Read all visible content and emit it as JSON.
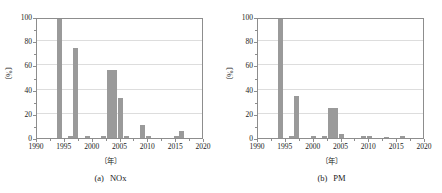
{
  "figure": {
    "background": "#ffffff",
    "bar_color": "#9a9a9a",
    "axis_color": "#8d8d8d",
    "grid_color": "#dddddd"
  },
  "panels": [
    {
      "caption_id": "(a)",
      "caption_text": "NOx",
      "ylabel": "〔%〕",
      "xlabel": "〔年〕",
      "y_ticks": [
        "0",
        "20",
        "40",
        "60",
        "80",
        "100"
      ],
      "x_ticks": [
        "1990",
        "1995",
        "2000",
        "2005",
        "2010",
        "2015",
        "2020"
      ]
    },
    {
      "caption_id": "(b)",
      "caption_text": "PM",
      "ylabel": "〔%〕",
      "xlabel": "〔年〕",
      "y_ticks": [
        "0",
        "20",
        "40",
        "60",
        "80",
        "100"
      ],
      "x_ticks": [
        "1990",
        "1995",
        "2000",
        "2005",
        "2010",
        "2015",
        "2020"
      ]
    }
  ],
  "chart_data": [
    {
      "type": "bar",
      "title": "(a) NOx",
      "xlabel": "〔年〕",
      "ylabel": "〔%〕",
      "xlim": [
        1990,
        2020
      ],
      "ylim": [
        0,
        100
      ],
      "xtick_step": 5,
      "ytick_step": 20,
      "grid": "horizontal",
      "legend": "none",
      "x": [
        1994,
        1996,
        1997,
        1999,
        2002,
        2003,
        2004,
        2005,
        2006,
        2009,
        2010,
        2015,
        2016
      ],
      "values": [
        100,
        1.5,
        74,
        1.5,
        1.5,
        56,
        56,
        33,
        1.5,
        11,
        1.5,
        1.5,
        6
      ]
    },
    {
      "type": "bar",
      "title": "(b) PM",
      "xlabel": "〔年〕",
      "ylabel": "〔%〕",
      "xlim": [
        1990,
        2020
      ],
      "ylim": [
        0,
        100
      ],
      "xtick_step": 5,
      "ytick_step": 20,
      "grid": "horizontal",
      "legend": "none",
      "x": [
        1994,
        1996,
        1997,
        2000,
        2002,
        2003,
        2004,
        2005,
        2009,
        2010,
        2013,
        2016
      ],
      "values": [
        100,
        1.5,
        35,
        1.5,
        1.5,
        25,
        25,
        3,
        1.5,
        1.5,
        1,
        1.5
      ]
    }
  ]
}
